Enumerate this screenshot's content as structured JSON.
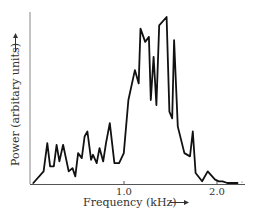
{
  "chart_data": {
    "type": "line",
    "title": "",
    "xlabel": "Frequency (kHz)",
    "ylabel": "Power (arbitary units)",
    "x_ticks": [
      "1.0",
      "2.0"
    ],
    "xlim": [
      0.0,
      2.3
    ],
    "ylim": [
      0,
      100
    ],
    "grid": false,
    "legend": null,
    "series": [
      {
        "name": "Power spectrum",
        "x": [
          0.03,
          0.14,
          0.18,
          0.21,
          0.25,
          0.28,
          0.31,
          0.35,
          0.41,
          0.45,
          0.48,
          0.51,
          0.55,
          0.58,
          0.61,
          0.65,
          0.67,
          0.71,
          0.74,
          0.78,
          0.81,
          0.85,
          0.9,
          0.95,
          1.0,
          1.05,
          1.12,
          1.16,
          1.18,
          1.23,
          1.27,
          1.29,
          1.32,
          1.35,
          1.38,
          1.46,
          1.49,
          1.52,
          1.54,
          1.58,
          1.65,
          1.71,
          1.74,
          1.77,
          1.84,
          1.9,
          1.98,
          2.02,
          2.06,
          2.11,
          2.15,
          2.22
        ],
        "y": [
          0,
          7,
          24,
          10,
          10,
          23,
          13,
          23,
          7,
          9,
          4,
          18,
          15,
          28,
          31,
          14,
          17,
          12,
          21,
          13,
          24,
          36,
          12,
          12,
          18,
          50,
          68,
          60,
          93,
          85,
          88,
          50,
          76,
          47,
          95,
          100,
          43,
          39,
          86,
          34,
          18,
          16,
          31,
          6,
          1,
          7,
          2,
          1,
          1,
          0,
          0,
          0
        ]
      }
    ]
  },
  "axes": {
    "x_label": "Frequency (kHz) —▶",
    "y_label": "Power (arbitary units) —▶",
    "x_tick_1": "1.0",
    "x_tick_2": "2.0"
  }
}
